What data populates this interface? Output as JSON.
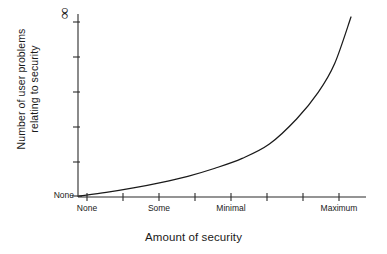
{
  "chart_data": {
    "type": "line",
    "title": "",
    "subtitle": "",
    "xlabel": "Amount of security",
    "ylabel": "Number of user problems relating to security",
    "ylabel_lines": [
      "Number of user problems",
      "relating to security"
    ],
    "y_tick_labels": [
      "None",
      "∞"
    ],
    "y_tick_top_label": "∞",
    "y_tick_bottom_label": "None",
    "y_tick_count": 6,
    "x_tick_labels": [
      "None",
      "Some",
      "Minimal",
      "Maximum"
    ],
    "x_tick_count": 8,
    "grid": false,
    "legend": "none",
    "xlim": [
      0,
      1
    ],
    "ylim": [
      0,
      1
    ],
    "series": [
      {
        "name": "User problems vs security",
        "x": [
          0.0,
          0.1,
          0.2,
          0.3,
          0.4,
          0.5,
          0.6,
          0.7,
          0.8,
          0.88,
          0.94,
          1.0
        ],
        "y": [
          0.0,
          0.02,
          0.045,
          0.075,
          0.11,
          0.155,
          0.21,
          0.29,
          0.43,
          0.58,
          0.74,
          1.0
        ],
        "color": "#1a1a1a"
      }
    ],
    "annotations": [
      {
        "text": "∞",
        "position": "y-axis-top",
        "meaning": "infinity"
      }
    ]
  },
  "axis": {
    "x_title": "Amount of security",
    "y_title_line1": "Number of user problems",
    "y_title_line2": "relating to security",
    "y_top": "∞",
    "y_bottom": "None",
    "x_ticks": [
      {
        "label": "None",
        "index": 0
      },
      {
        "label": "Some",
        "index": 1
      },
      {
        "label": "Minimal",
        "index": 2
      },
      {
        "label": "Maximum",
        "index": 3
      }
    ]
  },
  "colors": {
    "background": "#ffffff",
    "line": "#1a1a1a",
    "axis": "#2b2b2b",
    "text": "#1a1a1a"
  }
}
